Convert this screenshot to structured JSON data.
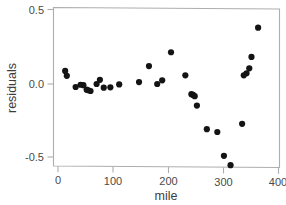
{
  "chart_data": {
    "type": "scatter",
    "title": "",
    "xlabel": "mile",
    "ylabel": "residuals",
    "xlim": [
      -8,
      410
    ],
    "ylim": [
      -0.585,
      0.5
    ],
    "grid": false,
    "legend": null,
    "xticks": [
      0,
      100,
      200,
      300,
      400
    ],
    "xtick_labels": [
      "0",
      "100",
      "200",
      "300",
      "400"
    ],
    "yticks": [
      -0.5,
      0.0,
      0.5
    ],
    "ytick_labels": [
      "-0.5",
      "0.0",
      "0.5"
    ],
    "point_color": "#141414",
    "point_size": 3.1,
    "frame_color": "#aeaeae",
    "x": [
      13,
      16,
      32,
      41,
      46,
      52,
      55,
      59,
      70,
      76,
      83,
      95,
      111,
      147,
      165,
      180,
      189,
      205,
      231,
      242,
      245,
      248,
      252,
      270,
      289,
      301,
      313,
      334,
      337,
      342,
      347,
      351,
      363
    ],
    "y": [
      0.088,
      0.055,
      -0.02,
      -0.005,
      -0.008,
      -0.038,
      -0.042,
      -0.047,
      0.0,
      0.028,
      -0.025,
      -0.022,
      -0.003,
      0.013,
      0.12,
      0.0,
      0.025,
      0.213,
      0.058,
      -0.068,
      -0.073,
      -0.082,
      -0.145,
      -0.303,
      -0.322,
      -0.482,
      -0.545,
      -0.267,
      0.058,
      0.072,
      0.105,
      0.182,
      0.378
    ],
    "n_points": 33
  },
  "axes": {
    "x_title": "mile",
    "y_title": "residuals"
  }
}
